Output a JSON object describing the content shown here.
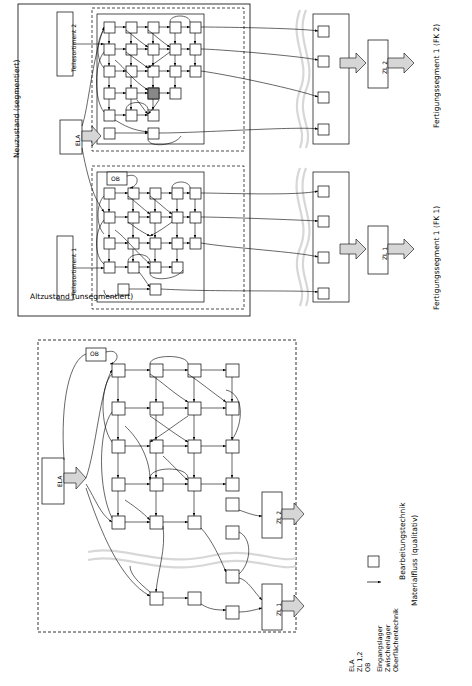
{
  "figure": {
    "panels": [
      {
        "id": "panel-top",
        "title": "Neuzustand (segmentiert)",
        "right_labels": [
          "Fertigungssegment 1 (FK 2)",
          "Fertigungssegment 1 (FK 1)"
        ],
        "left_labels": [
          "Teilesortiment 2",
          "Teilesortiment 1"
        ],
        "nodes": {
          "ela": "ELA",
          "ob": "OB",
          "zl2": "ZL 2",
          "zl1": "ZL 1"
        }
      },
      {
        "id": "panel-bottom",
        "title": "Altzustand (unsegmentiert)",
        "nodes": {
          "ela": "ELA",
          "ob": "OB",
          "zl2": "ZL 2",
          "zl1": "ZL 1"
        }
      }
    ],
    "legend": {
      "abbreviations": [
        {
          "key": "ELA",
          "text": "Eingangslager"
        },
        {
          "key": "ZL 1,2",
          "text": "Zwischenlager"
        },
        {
          "key": "OB",
          "text": "Oberflächentechnik"
        }
      ],
      "symbols": [
        {
          "glyph": "square",
          "label": "Bearbeitungstechnik"
        },
        {
          "glyph": "arrow",
          "label": "Materialfluss (qualitativ)"
        }
      ]
    }
  }
}
